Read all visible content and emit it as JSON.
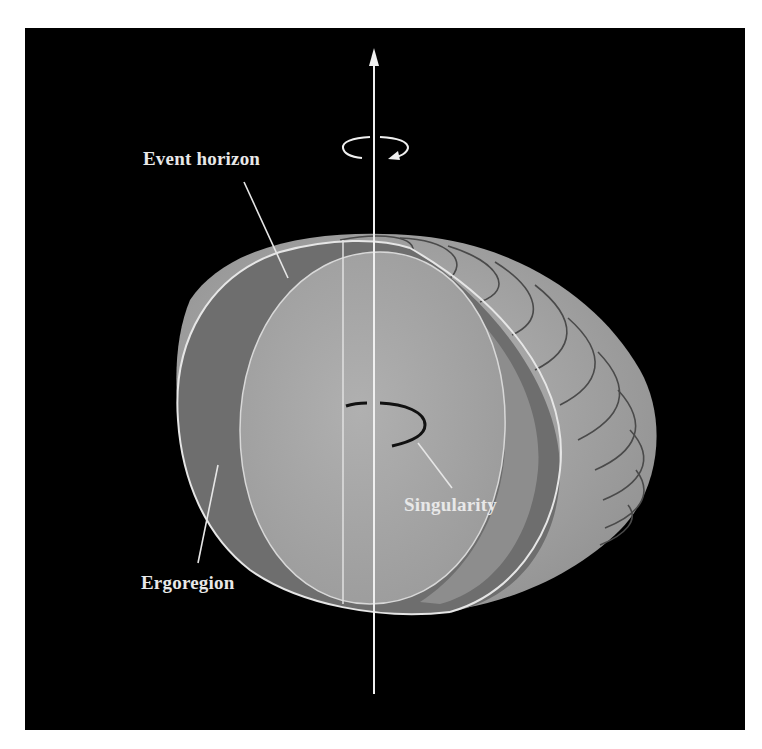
{
  "figure": {
    "labels": {
      "event_horizon": "Event horizon",
      "singularity": "Singularity",
      "ergoregion": "Ergoregion"
    },
    "elements": {
      "rotation_axis": "vertical arrow pointing up",
      "rotation_indicator": "curved arrow around axis (counterclockwise view)",
      "ring_singularity": "black ring at center"
    },
    "colors": {
      "background": "#000000",
      "frame": "#ffffff",
      "outer_shell": "#a9a9a9",
      "ergoregion_cut": "#6e6e6e",
      "horizon_face": "#a3a3a3",
      "inner_band": "#8a8a8a",
      "lines": "#e6e6e6",
      "ring": "#111111"
    }
  }
}
